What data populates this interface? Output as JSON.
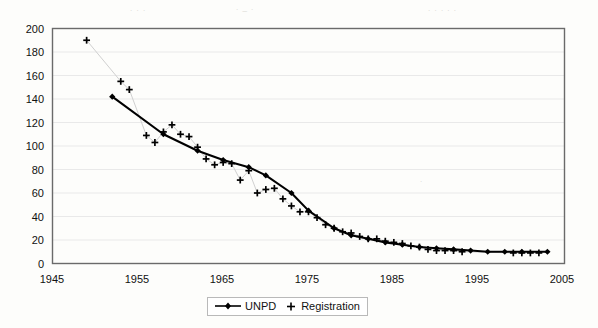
{
  "chart_data": {
    "type": "line",
    "title": "",
    "xlabel": "",
    "ylabel": "",
    "xlim": [
      1945,
      2005
    ],
    "ylim": [
      0,
      200
    ],
    "xticks": [
      1945,
      1955,
      1965,
      1975,
      1985,
      1995,
      2005
    ],
    "yticks": [
      0,
      20,
      40,
      60,
      80,
      100,
      120,
      140,
      160,
      180,
      200
    ],
    "grid": "horizontal",
    "legend_position": "bottom-center",
    "series": [
      {
        "name": "UNPD",
        "marker": "diamond",
        "style": "line-with-markers",
        "color": "#000000",
        "points": [
          [
            1952,
            142
          ],
          [
            1958,
            110
          ],
          [
            1962,
            96
          ],
          [
            1965,
            88
          ],
          [
            1968,
            82
          ],
          [
            1970,
            75
          ],
          [
            1973,
            60
          ],
          [
            1975,
            45
          ],
          [
            1978,
            30
          ],
          [
            1980,
            24
          ],
          [
            1982,
            21
          ],
          [
            1984,
            18
          ],
          [
            1986,
            16
          ],
          [
            1988,
            14
          ],
          [
            1990,
            13
          ],
          [
            1992,
            12
          ],
          [
            1994,
            11
          ],
          [
            1996,
            10
          ],
          [
            1998,
            10
          ],
          [
            2000,
            10
          ],
          [
            2003,
            10
          ]
        ]
      },
      {
        "name": "Registration",
        "marker": "plus",
        "style": "markers-only",
        "color": "#000000",
        "points": [
          [
            1949,
            190
          ],
          [
            1953,
            155
          ],
          [
            1954,
            148
          ],
          [
            1956,
            109
          ],
          [
            1957,
            103
          ],
          [
            1958,
            112
          ],
          [
            1959,
            118
          ],
          [
            1960,
            110
          ],
          [
            1961,
            108
          ],
          [
            1962,
            99
          ],
          [
            1963,
            89
          ],
          [
            1964,
            84
          ],
          [
            1965,
            86
          ],
          [
            1966,
            85
          ],
          [
            1967,
            71
          ],
          [
            1968,
            79
          ],
          [
            1969,
            60
          ],
          [
            1970,
            63
          ],
          [
            1971,
            64
          ],
          [
            1972,
            55
          ],
          [
            1973,
            49
          ],
          [
            1974,
            44
          ],
          [
            1975,
            44
          ],
          [
            1976,
            39
          ],
          [
            1977,
            33
          ],
          [
            1978,
            30
          ],
          [
            1979,
            27
          ],
          [
            1980,
            26
          ],
          [
            1981,
            23
          ],
          [
            1982,
            21
          ],
          [
            1983,
            21
          ],
          [
            1984,
            19
          ],
          [
            1985,
            18
          ],
          [
            1986,
            17
          ],
          [
            1987,
            15
          ],
          [
            1988,
            14
          ],
          [
            1989,
            12
          ],
          [
            1990,
            11
          ],
          [
            1991,
            11
          ],
          [
            1992,
            11
          ],
          [
            1993,
            10
          ],
          [
            1999,
            9
          ],
          [
            2000,
            9
          ],
          [
            2001,
            9
          ],
          [
            2002,
            9
          ]
        ]
      }
    ]
  },
  "legend": {
    "unpd_label": "UNPD",
    "registration_label": "Registration"
  },
  "axis": {
    "x_tick_labels": [
      "1945",
      "1955",
      "1965",
      "1975",
      "1985",
      "1995",
      "2005"
    ],
    "y_tick_labels": [
      "0",
      "20",
      "40",
      "60",
      "80",
      "100",
      "120",
      "140",
      "160",
      "180",
      "200"
    ]
  },
  "colors": {
    "ink": "#000000",
    "grid": "#e9e9e9",
    "frame": "#6a6a6a",
    "page": "#fdfdfb"
  }
}
